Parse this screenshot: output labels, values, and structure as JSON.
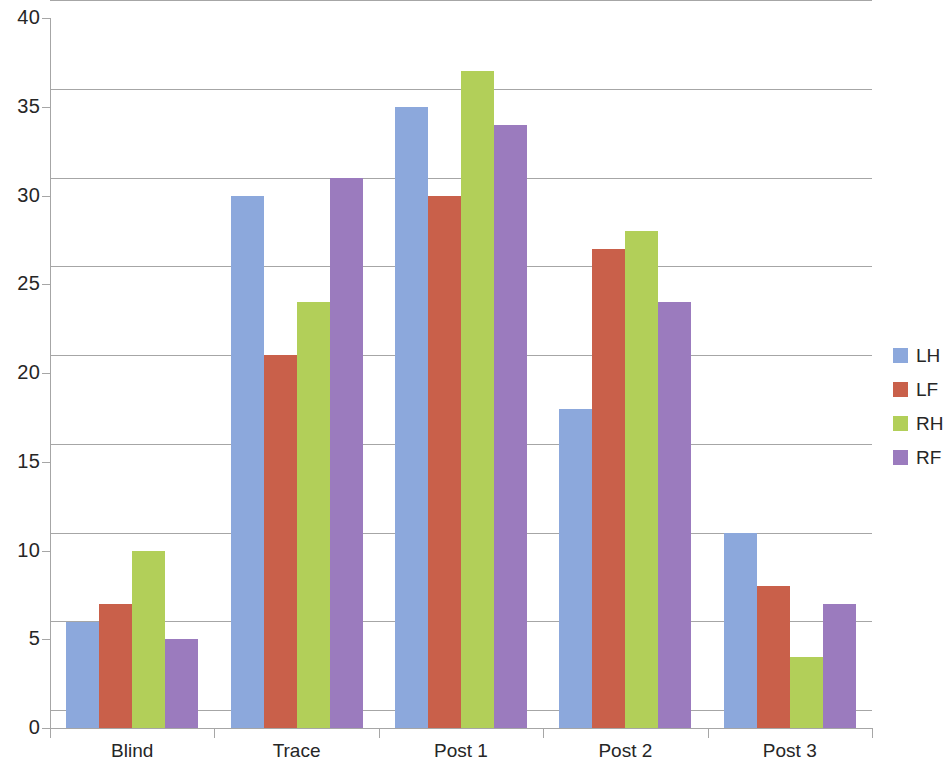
{
  "chart_data": {
    "type": "bar",
    "title": "",
    "subtitle": "",
    "xlabel": "",
    "ylabel": "",
    "categories": [
      "Blind",
      "Trace",
      "Post 1",
      "Post 2",
      "Post 3"
    ],
    "series": [
      {
        "name": "LH",
        "color": "#8CA8DC",
        "values": [
          6,
          30,
          35,
          18,
          11
        ]
      },
      {
        "name": "LF",
        "color": "#C9604A",
        "values": [
          7,
          21,
          30,
          27,
          8
        ]
      },
      {
        "name": "RH",
        "color": "#B2CF59",
        "values": [
          10,
          24,
          37,
          28,
          4
        ]
      },
      {
        "name": "RF",
        "color": "#9B7BBE",
        "values": [
          5,
          31,
          34,
          24,
          7
        ]
      }
    ],
    "ylim": [
      0,
      40
    ],
    "ytick_values": [
      0,
      5,
      10,
      15,
      20,
      25,
      30,
      35,
      40
    ],
    "ytick_labels": [
      "0",
      "5",
      "10",
      "15",
      "20",
      "25",
      "30",
      "35",
      "40"
    ],
    "grid": true,
    "grid_axis": "y",
    "legend_position": "right",
    "legend_entries": [
      "LH",
      "LF",
      "RH",
      "RF"
    ],
    "background_color": "#FFFFFF",
    "axis_color": "#A6A6A6",
    "grid_color": "#A6A6A6",
    "text_color": "#262626"
  }
}
